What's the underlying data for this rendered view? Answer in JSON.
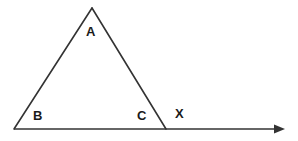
{
  "figure": {
    "background_color": "#ffffff",
    "stroke_color": "#333333",
    "label_color": "#1a1a1a",
    "stroke_width": 1.6,
    "width": 298,
    "height": 141,
    "points": {
      "A": {
        "x": 92,
        "y": 8
      },
      "B": {
        "x": 14,
        "y": 129
      },
      "C": {
        "x": 166,
        "y": 129
      },
      "ray_end": {
        "x": 285,
        "y": 129
      }
    },
    "labels": {
      "apex": "A",
      "bottom_left": "B",
      "bottom_right": "C",
      "exterior": "X"
    },
    "segments": [
      {
        "name": "AB",
        "from": "A",
        "to": "B"
      },
      {
        "name": "AC",
        "from": "A",
        "to": "C"
      },
      {
        "name": "BX",
        "from": "B",
        "to": "ray_end"
      }
    ],
    "arrowhead": {
      "tip_x": 285,
      "tip_y": 129,
      "back_x": 274,
      "half_height": 4.5
    }
  }
}
